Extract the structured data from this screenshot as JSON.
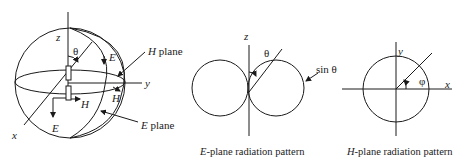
{
  "sphere_diagram": {
    "axis_z": "z",
    "axis_y": "y",
    "axis_x": "x",
    "theta": "θ",
    "E_label_top": "E",
    "E_label_bottom": "E",
    "H_label_mid": "H",
    "H_label_right": "H",
    "H_plane_letter": "H",
    "H_plane_word": " plane",
    "E_plane_letter": "E",
    "E_plane_word": " plane"
  },
  "e_plane_pattern": {
    "axis_z": "z",
    "theta": "θ",
    "sin_theta": "sin θ",
    "caption_letter": "E",
    "caption_rest": "-plane radiation pattern"
  },
  "h_plane_pattern": {
    "axis_y": "y",
    "axis_x": "x",
    "phi": "φ",
    "caption_letter": "H",
    "caption_rest": "-plane radiation pattern"
  },
  "colors": {
    "ink": "#1a1a1a",
    "background": "#ffffff"
  }
}
